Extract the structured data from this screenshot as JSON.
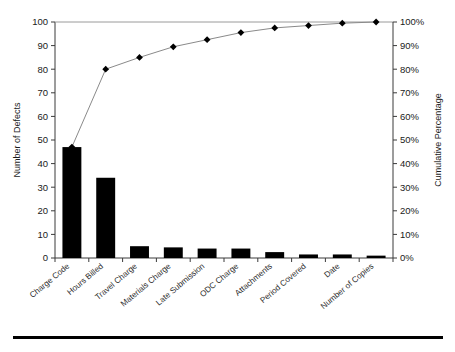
{
  "chart_data": {
    "type": "bar",
    "title": "",
    "xlabel": "",
    "ylabel": "Number of Defects",
    "y2label": "Cumulative Percentage",
    "ylim": [
      0,
      100
    ],
    "y2lim": [
      0,
      100
    ],
    "grid": false,
    "legend": "none",
    "categories": [
      "Charge Code",
      "Hours Billed",
      "Travel Charge",
      "Materials Charge",
      "Late Submission",
      "ODC Charge",
      "Attachments",
      "Period Covered",
      "Date",
      "Number of Copies"
    ],
    "values": [
      47,
      34,
      5,
      4.5,
      4,
      4,
      2.5,
      1.5,
      1.5,
      1
    ],
    "cumulative_percent": [
      47,
      80,
      85,
      89.5,
      92.5,
      95.5,
      97.5,
      98.5,
      99.5,
      100
    ],
    "series": [
      {
        "name": "Number of Defects",
        "type": "bar",
        "values": [
          47,
          34,
          5,
          4.5,
          4,
          4,
          2.5,
          1.5,
          1.5,
          1
        ]
      },
      {
        "name": "Cumulative Percentage",
        "type": "line",
        "values": [
          47,
          80,
          85,
          89.5,
          92.5,
          95.5,
          97.5,
          98.5,
          99.5,
          100
        ]
      }
    ],
    "yticks": [
      0,
      10,
      20,
      30,
      40,
      50,
      60,
      70,
      80,
      90,
      100
    ],
    "ytick_labels": [
      "0",
      "10",
      "20",
      "30",
      "40",
      "50",
      "60",
      "70",
      "80",
      "90",
      "100"
    ],
    "y2ticks": [
      0,
      10,
      20,
      30,
      40,
      50,
      60,
      70,
      80,
      90,
      100
    ],
    "y2tick_labels": [
      "0%",
      "10%",
      "20%",
      "30%",
      "40%",
      "50%",
      "60%",
      "70%",
      "80%",
      "90%",
      "100%"
    ],
    "colors": {
      "bar": "#000000",
      "line": "#8a8a8a",
      "marker": "#000000",
      "axis": "#3a3a3a",
      "text": "#1a1a1a",
      "rule": "#000000"
    }
  }
}
